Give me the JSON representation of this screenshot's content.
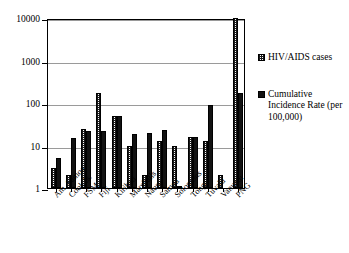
{
  "chart_data": {
    "type": "bar",
    "title": "",
    "xlabel": "",
    "ylabel": "",
    "yscale": "log",
    "ylim": [
      1,
      10000
    ],
    "yticks": [
      1,
      10,
      100,
      1000,
      10000
    ],
    "ytick_labels": [
      "1",
      "10",
      "100",
      "1000",
      "10000"
    ],
    "grid": true,
    "legend_position": "right",
    "categories": [
      "Am. Samoa",
      "Cook Is.",
      "FSM",
      "Fiji",
      "Kiribati",
      "Marshalls",
      "Nauru",
      "Samoa",
      "Solomons",
      "Tonga",
      "Tuvalu",
      "Vanuatu",
      "PNG"
    ],
    "series": [
      {
        "name": "HIV/AIDS cases",
        "pattern": "hatched",
        "color": "#1a1a1a",
        "values": [
          3,
          2,
          25,
          170,
          50,
          10,
          2,
          13,
          10,
          16,
          13,
          2,
          10000
        ]
      },
      {
        "name": "Cumulative Incidence Rate (per 100,000)",
        "pattern": "solid",
        "color": "#121212",
        "values": [
          5,
          15,
          22,
          22,
          50,
          19,
          20,
          23,
          1.1,
          16,
          90,
          null,
          170
        ]
      }
    ]
  },
  "legend": {
    "entries": [
      {
        "label": "HIV/AIDS cases",
        "swatch": "hatched"
      },
      {
        "label": "Cumulative Incidence Rate (per 100,000)",
        "swatch": "solid"
      }
    ]
  }
}
